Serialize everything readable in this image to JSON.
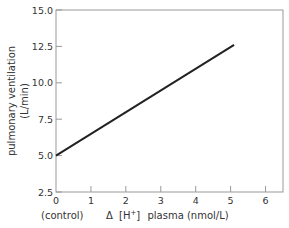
{
  "chart_data": {
    "type": "line",
    "title": "",
    "xlabel": "Δ [H⁺] plasma (nmol/L)",
    "xlabel_parts": {
      "delta": "Δ",
      "h_open": "[H",
      "h_sup": "+",
      "h_close": "]",
      "rest": "plasma (nmol/L)"
    },
    "x_zero_annotation": "(control)",
    "ylabel_line1": "pulmonary ventilation",
    "ylabel_line2": "(L/min)",
    "xlim": [
      0,
      6.5
    ],
    "ylim": [
      2.5,
      15.0
    ],
    "x_ticks": [
      0,
      1,
      2,
      3,
      4,
      5,
      6
    ],
    "x_tick_labels": [
      "0",
      "1",
      "2",
      "3",
      "4",
      "5",
      "6"
    ],
    "y_ticks": [
      2.5,
      5.0,
      7.5,
      10.0,
      12.5,
      15.0
    ],
    "y_tick_labels": [
      "2.5",
      "5.0",
      "7.5",
      "10.0",
      "12.5",
      "15.0"
    ],
    "grid": false,
    "legend": null,
    "series": [
      {
        "name": "ventilation",
        "x": [
          0,
          5.1
        ],
        "y": [
          5.0,
          12.6
        ]
      }
    ]
  }
}
